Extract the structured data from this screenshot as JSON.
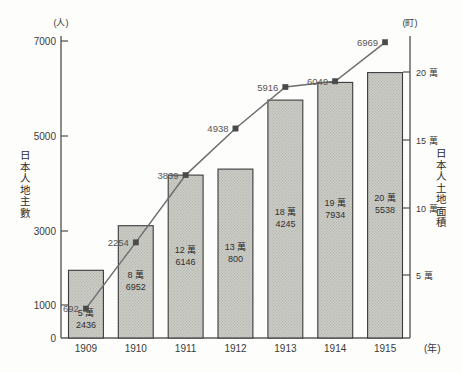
{
  "chart_data": {
    "type": "bar",
    "title": "",
    "subtitle": "",
    "xlabel": "(年)",
    "ylabel": "日本人地主數",
    "y2label": "日本人土地面積",
    "left_axis_unit": "(人)",
    "right_axis_unit": "(町)",
    "categories": [
      "1909",
      "1910",
      "1911",
      "1912",
      "1913",
      "1914",
      "1915"
    ],
    "ylim": [
      0,
      7000
    ],
    "yticks": [
      "0",
      "1000",
      "3000",
      "5000",
      "7000"
    ],
    "ytick_values": [
      0,
      1000,
      3000,
      5000,
      7000
    ],
    "y2lim": [
      0,
      230000
    ],
    "y2ticks": [
      "5 萬",
      "10 萬",
      "15 萬",
      "20 萬"
    ],
    "y2tick_values": [
      50000,
      100000,
      150000,
      200000
    ],
    "grid": false,
    "legend": "none",
    "series": [
      {
        "name": "日本人土地面積",
        "render": "bar",
        "axis": "right",
        "unit": "町",
        "values": [
          52436,
          86952,
          126146,
          130800,
          184245,
          197934,
          205538
        ],
        "labels": [
          {
            "major": "5 萬",
            "minor": "2436"
          },
          {
            "major": "8 萬",
            "minor": "6952"
          },
          {
            "major": "12 萬",
            "minor": "6146"
          },
          {
            "major": "13 萬",
            "minor": "800"
          },
          {
            "major": "18 萬",
            "minor": "4245"
          },
          {
            "major": "19 萬",
            "minor": "7934"
          },
          {
            "major": "20 萬",
            "minor": "5538"
          }
        ]
      },
      {
        "name": "日本人地主數",
        "render": "line",
        "axis": "left",
        "unit": "人",
        "values": [
          692,
          2254,
          3839,
          4938,
          5916,
          6049,
          6969
        ],
        "labels": [
          "692",
          "2254",
          "3839",
          "4938",
          "5916",
          "6049",
          "6969"
        ]
      }
    ]
  },
  "colors": {
    "bar_fill": "#c9c9c4",
    "bar_stroke": "#3b3b3b",
    "line_stroke": "#6e6e6e",
    "marker_fill": "#4a4a4a",
    "axis": "#5a5a5a",
    "text": "#2b2b2b",
    "background": "#fdfdfc"
  },
  "axis_titles": {
    "left_chars": [
      "日",
      "本",
      "人",
      "地",
      "主",
      "數"
    ],
    "right_chars": [
      "日",
      "本",
      "人",
      "土",
      "地",
      "面",
      "積"
    ]
  }
}
